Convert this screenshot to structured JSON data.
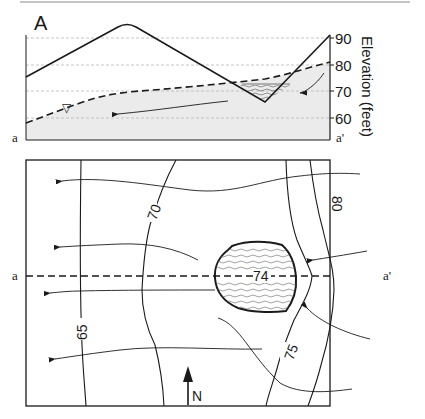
{
  "cross_section": {
    "panel_label": "A",
    "axis_title": "Elevation (feet)",
    "ticks": [
      "90",
      "80",
      "70",
      "60"
    ],
    "left_end_label": "a",
    "right_end_label": "a'",
    "water_table_symbol": "▽"
  },
  "map": {
    "contour_labels": [
      "65",
      "70",
      "75",
      "80"
    ],
    "lake_label": "74",
    "section_left_label": "a",
    "section_right_label": "a'",
    "north_label": "N"
  },
  "colors": {
    "line": "#1a1a1a",
    "grid": "#b8b8b8",
    "saturated_fill": "#ebebeb",
    "background": "#ffffff"
  }
}
